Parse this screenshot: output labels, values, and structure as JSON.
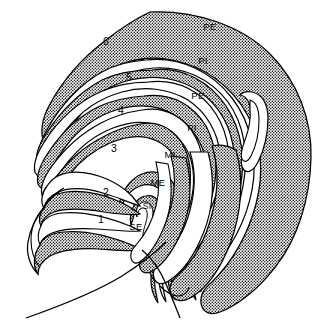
{
  "figure": {
    "background_color": "#ffffff",
    "line_color": "#000000",
    "stipple_color": "#000000",
    "fill_color": "#ffffff"
  },
  "labels": {
    "pe_outer": "PE",
    "pi_outer": "PI",
    "pe_inner": "PE",
    "pi_inner": "PI",
    "mi": "MI",
    "me": "ME",
    "si": "SI",
    "se": "SE",
    "n1": "1",
    "n2": "2",
    "n3": "3",
    "n4": "4",
    "n5": "5",
    "n6": "6"
  },
  "label_positions": [
    {
      "name": "pe_outer",
      "x": 210,
      "y": 30,
      "band": "stippled"
    },
    {
      "name": "pi_outer",
      "x": 203,
      "y": 64,
      "band": "white"
    },
    {
      "name": "n6",
      "x": 106,
      "y": 45,
      "band": "stippled"
    },
    {
      "name": "n5",
      "x": 129,
      "y": 81,
      "band": "white"
    },
    {
      "name": "pe_inner",
      "x": 198,
      "y": 99,
      "band": "stippled"
    },
    {
      "name": "n4",
      "x": 121,
      "y": 114,
      "band": "stippled"
    },
    {
      "name": "pi_inner",
      "x": 192,
      "y": 131,
      "band": "white"
    },
    {
      "name": "n3",
      "x": 114,
      "y": 152,
      "band": "white"
    },
    {
      "name": "mi",
      "x": 170,
      "y": 158,
      "band": "white"
    },
    {
      "name": "me",
      "x": 158,
      "y": 186,
      "band": "stippled"
    },
    {
      "name": "n2",
      "x": 106,
      "y": 196,
      "band": "white"
    },
    {
      "name": "si",
      "x": 148,
      "y": 208,
      "band": "stippled"
    },
    {
      "name": "n1",
      "x": 101,
      "y": 223,
      "band": "stippled"
    },
    {
      "name": "se",
      "x": 136,
      "y": 229,
      "band": "white"
    }
  ]
}
